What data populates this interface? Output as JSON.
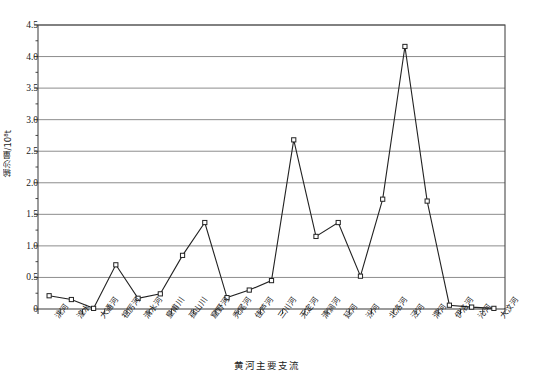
{
  "chart_data": {
    "type": "line",
    "title": "",
    "xlabel": "黄河主要支流",
    "ylabel": "输沙量/10⁸t",
    "ylim": [
      0,
      4.5
    ],
    "ytick_step": 0.5,
    "grid": true,
    "legend": "none",
    "marker": "open-square",
    "line_color": "#222222",
    "grid_color": "#808080",
    "axis_color": "#555555",
    "categories": [
      "洮河",
      "湟水",
      "大通河",
      "祖厉河",
      "清水河",
      "皇甫川",
      "孤山川",
      "窟野河",
      "秃尾河",
      "佳芦河",
      "三川河",
      "无定河",
      "清涧河",
      "延河",
      "汾河",
      "北洛河",
      "泾河",
      "渭河",
      "伊洛河",
      "沁河",
      "大汶河"
    ],
    "values": [
      0.21,
      0.15,
      0.01,
      0.7,
      0.17,
      0.24,
      0.85,
      1.37,
      0.18,
      0.3,
      0.45,
      2.68,
      1.15,
      1.37,
      0.52,
      1.74,
      4.16,
      1.71,
      0.06,
      0.03,
      0.01
    ],
    "ytick_labels": [
      "0",
      "0.5",
      "1.0",
      "1.5",
      "2.0",
      "2.5",
      "3.0",
      "3.5",
      "4.0",
      "4.5"
    ],
    "ytick_values": [
      0,
      0.5,
      1.0,
      1.5,
      2.0,
      2.5,
      3.0,
      3.5,
      4.0,
      4.5
    ]
  }
}
